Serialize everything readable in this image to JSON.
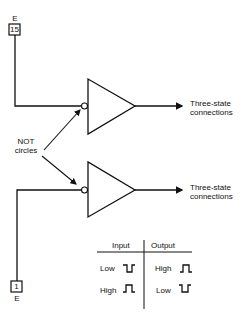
{
  "diagram": {
    "title": "",
    "top_gate": {
      "pin_label": "E",
      "pin_number": "15",
      "output_label_line1": "Three-state",
      "output_label_line2": "connections"
    },
    "bottom_gate": {
      "pin_label": "E",
      "pin_number": "1",
      "output_label_line1": "Three-state",
      "output_label_line2": "connections"
    },
    "annotation": {
      "line1": "NOT",
      "line2": "circles"
    },
    "truth_table": {
      "headers": [
        "Input",
        "Output"
      ],
      "rows": [
        {
          "input": "Low",
          "input_wave": "low-pulse",
          "output": "High",
          "output_wave": "high-pulse"
        },
        {
          "input": "High",
          "input_wave": "high-pulse",
          "output": "Low",
          "output_wave": "low-pulse"
        }
      ]
    },
    "colors": {
      "line": "#111111",
      "background": "#ffffff"
    }
  }
}
